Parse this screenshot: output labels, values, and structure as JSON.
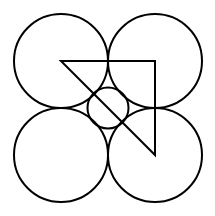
{
  "diagram": {
    "background": "#ffffff",
    "stroke_color": "#000000",
    "stroke_width": 2,
    "large_circles": [
      {
        "name": "top-left",
        "cx": 61,
        "cy": 61,
        "r": 47
      },
      {
        "name": "top-right",
        "cx": 155,
        "cy": 61,
        "r": 47
      },
      {
        "name": "bottom-left",
        "cx": 61,
        "cy": 155,
        "r": 47
      },
      {
        "name": "bottom-right",
        "cx": 155,
        "cy": 155,
        "r": 47
      }
    ],
    "center_circle": {
      "cx": 108,
      "cy": 108,
      "r": 20.5
    },
    "triangle": {
      "points": [
        [
          61,
          61
        ],
        [
          155,
          61
        ],
        [
          155,
          155
        ]
      ]
    }
  }
}
